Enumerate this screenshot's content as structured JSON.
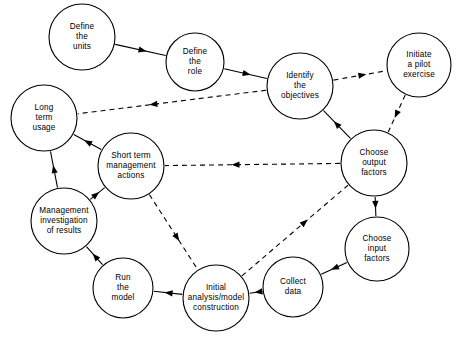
{
  "diagram": {
    "background_color": "#ffffff",
    "line_color": "#000000",
    "nodes": [
      {
        "id": "define_units",
        "label_lines": [
          "Define",
          "the",
          "units"
        ],
        "cx": 82,
        "cy": 37,
        "r": 33
      },
      {
        "id": "define_role",
        "label_lines": [
          "Define",
          "the",
          "role"
        ],
        "cx": 195,
        "cy": 62,
        "r": 29
      },
      {
        "id": "identify_objectives",
        "label_lines": [
          "Identify",
          "the",
          "objectives"
        ],
        "cx": 300,
        "cy": 86,
        "r": 33
      },
      {
        "id": "initiate_pilot",
        "label_lines": [
          "Initiate",
          "a pilot",
          "exercise"
        ],
        "cx": 419,
        "cy": 65,
        "r": 32
      },
      {
        "id": "long_term_usage",
        "label_lines": [
          "Long",
          "term",
          "usage"
        ],
        "cx": 44,
        "cy": 118,
        "r": 33
      },
      {
        "id": "short_term_actions",
        "label_lines": [
          "Short term",
          "management",
          "actions"
        ],
        "cx": 131,
        "cy": 166,
        "r": 33
      },
      {
        "id": "choose_output",
        "label_lines": [
          "Choose",
          "output",
          "factors"
        ],
        "cx": 374,
        "cy": 163,
        "r": 33
      },
      {
        "id": "mgmt_investigation",
        "label_lines": [
          "Management",
          "investigation",
          "of  results"
        ],
        "cx": 64,
        "cy": 221,
        "r": 33
      },
      {
        "id": "choose_input",
        "label_lines": [
          "Choose",
          "input",
          "factors"
        ],
        "cx": 377,
        "cy": 249,
        "r": 32
      },
      {
        "id": "run_model",
        "label_lines": [
          "Run",
          "the",
          "model"
        ],
        "cx": 123,
        "cy": 288,
        "r": 30
      },
      {
        "id": "initial_analysis",
        "label_lines": [
          "Initial",
          "analysis/model",
          "construction"
        ],
        "cx": 216,
        "cy": 298,
        "r": 33
      },
      {
        "id": "collect_data",
        "label_lines": [
          "Collect",
          "data"
        ],
        "cx": 293,
        "cy": 287,
        "r": 30
      }
    ],
    "edges": [
      {
        "id": "e1",
        "from": "define_units",
        "to": "define_role",
        "style": "solid"
      },
      {
        "id": "e2",
        "from": "define_role",
        "to": "identify_objectives",
        "style": "solid"
      },
      {
        "id": "e3",
        "from": "identify_objectives",
        "to": "initiate_pilot",
        "style": "dashed"
      },
      {
        "id": "e4",
        "from": "initiate_pilot",
        "to": "choose_output",
        "style": "dashed"
      },
      {
        "id": "e5",
        "from": "choose_output",
        "to": "identify_objectives",
        "style": "solid"
      },
      {
        "id": "e6",
        "from": "identify_objectives",
        "to": "long_term_usage",
        "style": "dashed"
      },
      {
        "id": "e7",
        "from": "choose_output",
        "to": "short_term_actions",
        "style": "dashed"
      },
      {
        "id": "e8",
        "from": "short_term_actions",
        "to": "long_term_usage",
        "style": "solid"
      },
      {
        "id": "e9",
        "from": "mgmt_investigation",
        "to": "long_term_usage",
        "style": "solid"
      },
      {
        "id": "e10",
        "from": "mgmt_investigation",
        "to": "short_term_actions",
        "style": "solid"
      },
      {
        "id": "e11",
        "from": "choose_output",
        "to": "choose_input",
        "style": "solid"
      },
      {
        "id": "e12",
        "from": "choose_input",
        "to": "collect_data",
        "style": "solid"
      },
      {
        "id": "e13",
        "from": "collect_data",
        "to": "initial_analysis",
        "style": "solid"
      },
      {
        "id": "e14",
        "from": "initial_analysis",
        "to": "run_model",
        "style": "solid"
      },
      {
        "id": "e15",
        "from": "run_model",
        "to": "mgmt_investigation",
        "style": "solid"
      },
      {
        "id": "e16",
        "from": "short_term_actions",
        "to": "initial_analysis",
        "style": "dashed"
      },
      {
        "id": "e17",
        "from": "initial_analysis",
        "to": "choose_output",
        "style": "dashed"
      }
    ]
  }
}
